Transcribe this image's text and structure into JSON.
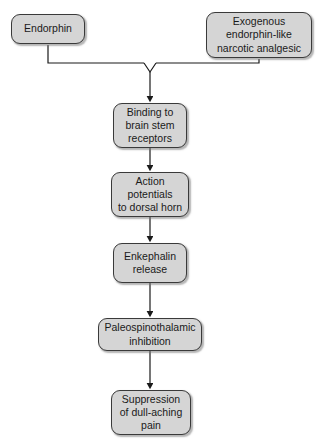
{
  "diagram": {
    "type": "flowchart",
    "orientation": "vertical",
    "top_edge_artifact": "—  —  —        · · ·            ·            · · · · · · · · ·                           ·",
    "style": {
      "box_fill": "#d5d5d5",
      "box_border": "#3a3a3a",
      "text_color": "#1a1a1a",
      "connector_color": "#1a1a1a",
      "background": "#ffffff"
    },
    "nodes": [
      {
        "id": "endorphin",
        "label": "Endorphin",
        "role": "source"
      },
      {
        "id": "exogenous",
        "label": "Exogenous\nendorphin-like\nnarcotic analgesic",
        "role": "source"
      },
      {
        "id": "binding",
        "label": "Binding to\nbrain stem\nreceptors",
        "role": "process"
      },
      {
        "id": "action",
        "label": "Action\npotentials\nto dorsal horn",
        "role": "process"
      },
      {
        "id": "enkephalin",
        "label": "Enkephalin\nrelease",
        "role": "process"
      },
      {
        "id": "paleospino",
        "label": "Paleospinothalamic\ninhibition",
        "role": "process"
      },
      {
        "id": "suppression",
        "label": "Suppression\nof dull-aching\npain",
        "role": "outcome"
      }
    ],
    "edges": [
      {
        "from": "endorphin",
        "to": "binding",
        "style": "elbow-merge"
      },
      {
        "from": "exogenous",
        "to": "binding",
        "style": "elbow-merge"
      },
      {
        "from": "binding",
        "to": "action",
        "style": "straight-arrow"
      },
      {
        "from": "action",
        "to": "enkephalin",
        "style": "straight-arrow"
      },
      {
        "from": "enkephalin",
        "to": "paleospino",
        "style": "straight-arrow"
      },
      {
        "from": "paleospino",
        "to": "suppression",
        "style": "straight-arrow"
      }
    ]
  }
}
